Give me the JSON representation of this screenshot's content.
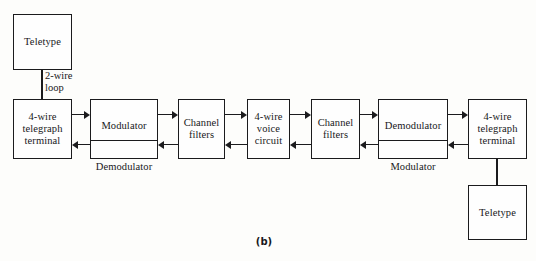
{
  "figure": {
    "caption": "(b)",
    "blocks": {
      "teletype_left": "Teletype",
      "terminal_left": "4-wire\ntelegraph\nterminal",
      "modulator_left": "Modulator",
      "demodulator_left": "Demodulator",
      "channel_filters_left": "Channel\nfilters",
      "voice_circuit": "4-wire\nvoice\ncircuit",
      "channel_filters_right": "Channel\nfilters",
      "demodulator_right": "Demodulator",
      "modulator_right": "Modulator",
      "terminal_right": "4-wire\ntelegraph\nterminal",
      "teletype_right": "Teletype"
    },
    "labels": {
      "two_wire_loop": "2-wire\nloop"
    },
    "colors": {
      "line": "#1b1b1d",
      "background": "#fdfdfb",
      "box_fill": "#fefefe"
    }
  }
}
